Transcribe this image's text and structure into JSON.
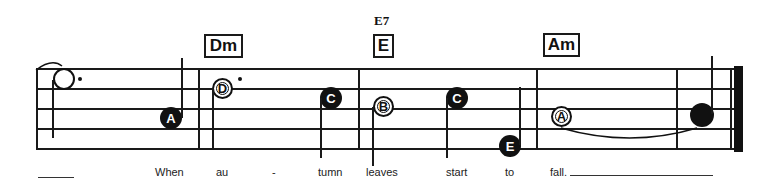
{
  "score": {
    "chords": [
      {
        "id": "dm",
        "label": "Dm",
        "alt": null
      },
      {
        "id": "e",
        "label": "E",
        "alt": "E7"
      },
      {
        "id": "am",
        "label": "Am",
        "alt": null
      }
    ],
    "notes": [
      {
        "name": "",
        "type": "half-open-dotted"
      },
      {
        "name": "A",
        "type": "filled"
      },
      {
        "name": "D",
        "type": "open-dotted"
      },
      {
        "name": "C",
        "type": "filled"
      },
      {
        "name": "B",
        "type": "open"
      },
      {
        "name": "C",
        "type": "filled"
      },
      {
        "name": "E",
        "type": "filled"
      },
      {
        "name": "A",
        "type": "open"
      },
      {
        "name": "",
        "type": "filled-large"
      }
    ],
    "lyrics": [
      "When",
      "au",
      "-",
      "tumn",
      "leaves",
      "start",
      "to",
      "fall."
    ],
    "colors": {
      "ink": "#111111",
      "background": "#ffffff"
    }
  }
}
